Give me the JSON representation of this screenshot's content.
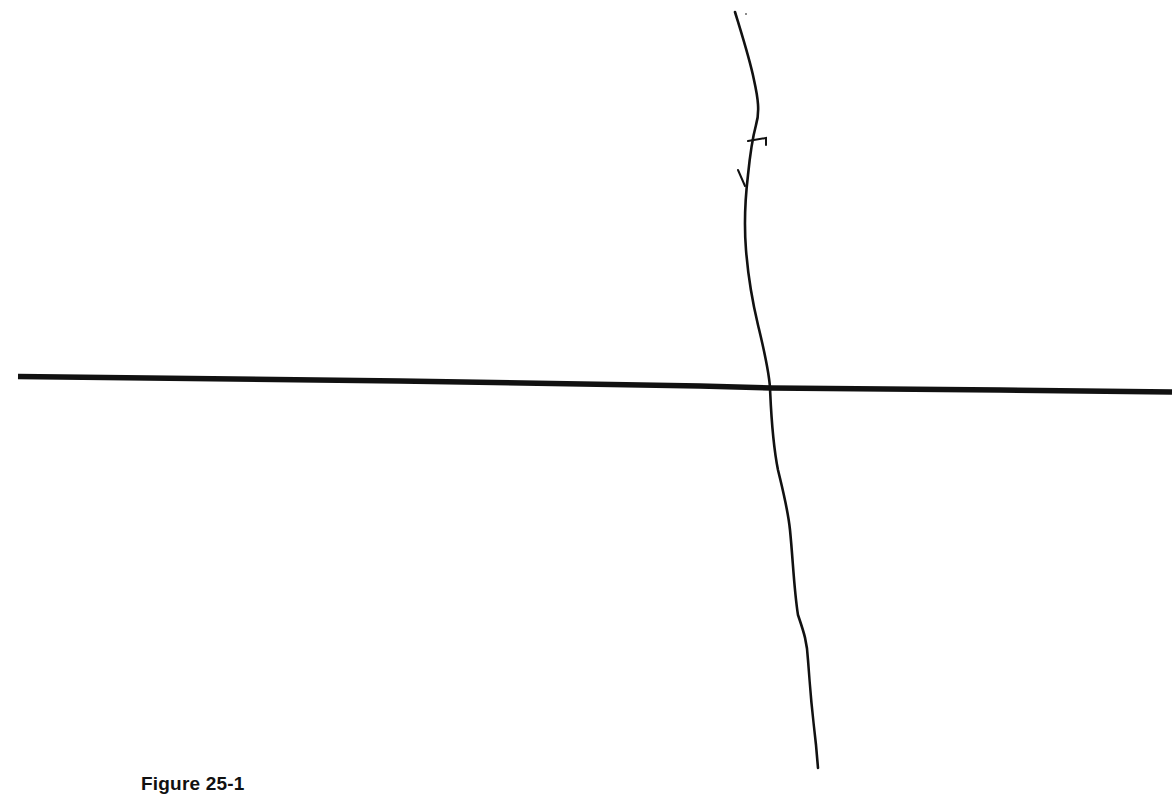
{
  "figure": {
    "caption": "Figure 25-1",
    "ink_color": "#111111",
    "background_color": "#ffffff",
    "elements": [
      {
        "name": "horizontal-axis-line",
        "description": "thick straight horizontal line, slightly sloping down to the right"
      },
      {
        "name": "vertical-hand-drawn-line",
        "description": "thin wavy hand-drawn vertical line crossing the horizontal line"
      },
      {
        "name": "small-hook-mark",
        "description": "small hand-drawn tick on the upper vertical line"
      },
      {
        "name": "small-slash-mark",
        "description": "short hand-drawn slash left of the upper vertical line"
      }
    ]
  }
}
